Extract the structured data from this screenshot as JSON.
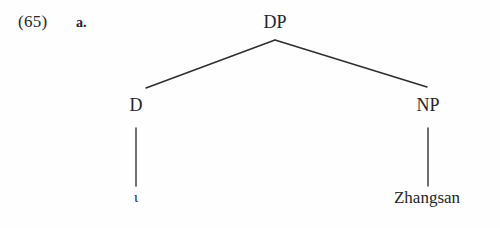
{
  "figure": {
    "example_number": "(65)",
    "subexample_label": "a.",
    "background_color": "#fefefe",
    "line_color": "#2b2b30",
    "text_color": "#25252a"
  },
  "tree": {
    "type": "syntax-tree",
    "root": {
      "label": "DP",
      "x": 275,
      "y": 30
    },
    "nodes": [
      {
        "id": "dp",
        "label": "DP",
        "x": 275,
        "y": 30,
        "level": 0
      },
      {
        "id": "d",
        "label": "D",
        "x": 136,
        "y": 113,
        "level": 1
      },
      {
        "id": "np",
        "label": "NP",
        "x": 428,
        "y": 113,
        "level": 1
      },
      {
        "id": "d-terminal",
        "label": "ι",
        "x": 136,
        "y": 205,
        "level": 2
      },
      {
        "id": "np-terminal",
        "label": "Zhangsan",
        "x": 427,
        "y": 205,
        "level": 2
      }
    ],
    "branches": [
      {
        "from": "dp",
        "to": "d",
        "x1": 275,
        "y1": 40,
        "x2": 146,
        "y2": 88,
        "style": "diagonal"
      },
      {
        "from": "dp",
        "to": "np",
        "x1": 275,
        "y1": 40,
        "x2": 427,
        "y2": 87,
        "style": "diagonal"
      },
      {
        "from": "d",
        "to": "d-terminal",
        "x1": 136,
        "y1": 128,
        "x2": 136,
        "y2": 186,
        "style": "vertical"
      },
      {
        "from": "np",
        "to": "np-terminal",
        "x1": 428,
        "y1": 128,
        "x2": 428,
        "y2": 186,
        "style": "vertical"
      }
    ]
  },
  "labels": {
    "dp": "DP",
    "d": "D",
    "np": "NP",
    "d_terminal": "ι",
    "np_terminal": "Zhangsan"
  }
}
